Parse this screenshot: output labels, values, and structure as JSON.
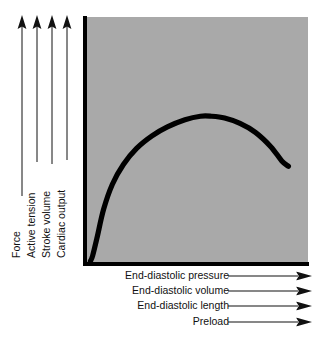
{
  "figure": {
    "type": "frank-starling-curve",
    "plot_background_color": "#a9a9a9",
    "curve_color": "#000000",
    "axis_color": "#000000",
    "page_background_color": "#ffffff"
  },
  "y_axis": {
    "arrow_direction": "up",
    "labels": [
      {
        "text": "Force",
        "arrow_icon": "up-arrow-icon"
      },
      {
        "text": "Active tension",
        "arrow_icon": "up-arrow-icon"
      },
      {
        "text": "Stroke volume",
        "arrow_icon": "up-arrow-icon"
      },
      {
        "text": "Cardiac output",
        "arrow_icon": "up-arrow-icon"
      }
    ]
  },
  "x_axis": {
    "arrow_direction": "right",
    "labels": [
      {
        "text": "End-diastolic pressure",
        "arrow_icon": "right-arrow-icon"
      },
      {
        "text": "End-diastolic volume",
        "arrow_icon": "right-arrow-icon"
      },
      {
        "text": "End-diastolic length",
        "arrow_icon": "right-arrow-icon"
      },
      {
        "text": "Preload",
        "arrow_icon": "right-arrow-icon"
      }
    ]
  },
  "chart_data": {
    "type": "line",
    "title": "",
    "subtitle": "",
    "xlabel": "End-diastolic pressure / End-diastolic volume / End-diastolic length / Preload",
    "ylabel": "Force / Active tension / Stroke volume / Cardiac output",
    "xlim": [
      0,
      100
    ],
    "ylim": [
      0,
      100
    ],
    "grid": false,
    "legend": "none",
    "axis_ticks": "none",
    "annotations": [
      "Ascending limb rises steeply then plateaus",
      "Peak (optimal preload) near 57% of x-range",
      "Descending limb falls after the peak"
    ],
    "series": [
      {
        "name": "Frank-Starling ventricular function curve",
        "color": "#000000",
        "x": [
          2,
          3,
          5,
          8,
          12,
          17,
          23,
          30,
          37,
          45,
          52,
          57,
          63,
          70,
          77,
          84,
          89,
          92
        ],
        "y": [
          1,
          4,
          14,
          30,
          44,
          55,
          64,
          71,
          76,
          80,
          82,
          82,
          81,
          78,
          73,
          65,
          57,
          54
        ]
      }
    ]
  }
}
